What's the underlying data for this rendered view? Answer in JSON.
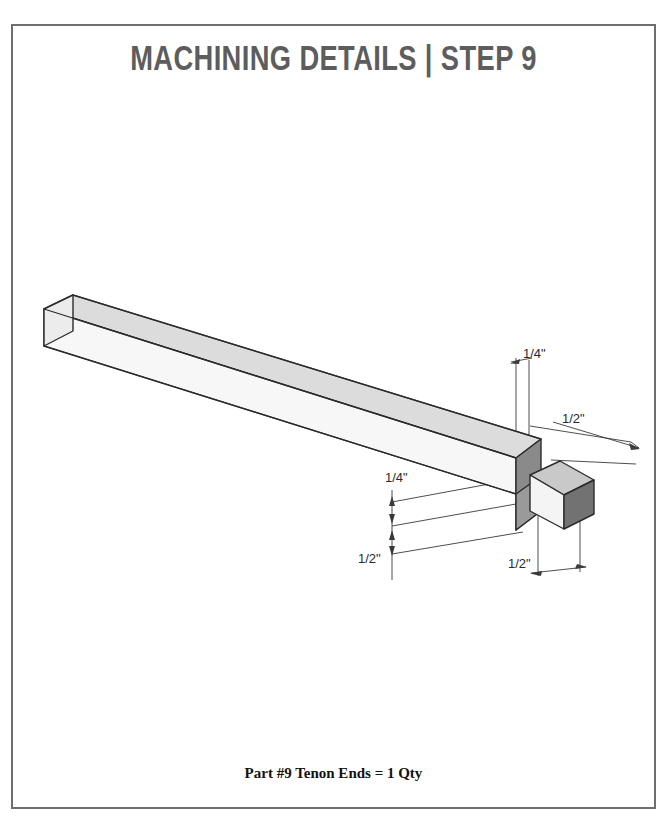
{
  "page": {
    "background_color": "#ffffff",
    "border_color": "#6e6e6e"
  },
  "header": {
    "title": "MACHINING DETAILS | STEP 9",
    "title_color": "#5d5d5d"
  },
  "footer": {
    "caption": "Part #9 Tenon Ends = 1 Qty",
    "caption_color": "#14120f"
  },
  "drawing": {
    "name": "isometric-tenon-beam",
    "description": "Isometric view of a long square-section wooden beam with a tenon machined on the lower-right end",
    "colors": {
      "outline": "#2b2b2b",
      "top_face": "#dcdcdc",
      "front_face": "#f6f6f6",
      "side_face": "#8d8d8d",
      "shoulder_face": "#8a8a8a",
      "tenon_top_face": "#c9c9c9",
      "tenon_front_face": "#f2f2f2",
      "tenon_side_face": "#707070",
      "dimension_line": "#3a3a3a"
    },
    "dimensions": [
      {
        "id": "tenon-width-top",
        "label": "1/4\"",
        "x": 512,
        "y": 352
      },
      {
        "id": "tenon-depth-right",
        "label": "1/2\"",
        "x": 561,
        "y": 416
      },
      {
        "id": "tenon-offset-left",
        "label": "1/4\"",
        "x": 383,
        "y": 476
      },
      {
        "id": "beam-height-left",
        "label": "1/2\"",
        "x": 358,
        "y": 556
      },
      {
        "id": "tenon-width-bottom",
        "label": "1/2\"",
        "x": 508,
        "y": 560
      }
    ]
  }
}
